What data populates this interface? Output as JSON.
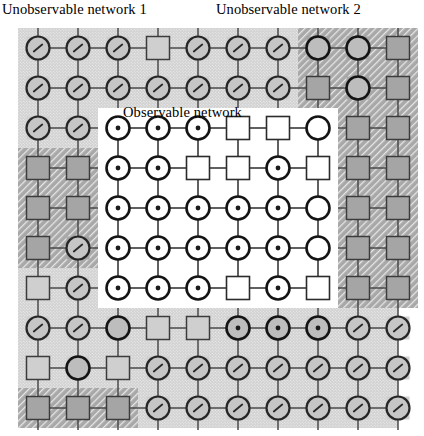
{
  "labels": {
    "unobservable_1": "Unobservable network 1",
    "unobservable_2": "Unobservable network 2",
    "observable": "Observable network"
  },
  "colors": {
    "node_stroke_dark": "#141414",
    "node_stroke_mid": "#3a3a3a",
    "edge": "#4a4a4a",
    "bg_light": "#d2d2d2",
    "bg_dark": "#a8a8a8",
    "bg_white": "#ffffff",
    "text": "#000000"
  },
  "icons": {
    "node_meter": "circle-with-tick-icon",
    "node_dot": "circle-with-dot-icon",
    "node_plain_circle": "plain-circle-icon",
    "node_square": "square-node-icon"
  },
  "chart_data": {
    "type": "diagram",
    "grid": {
      "rows": 10,
      "cols": 10,
      "origin_x": 38,
      "origin_y": 48,
      "spacing": 40,
      "node_radius": 11.5,
      "square_half": 11.5
    },
    "regions": [
      {
        "name": "unobservable-network-1-main",
        "style": "light",
        "x": 18,
        "y": 28,
        "w": 280,
        "h": 120
      },
      {
        "name": "unobservable-network-1-left",
        "style": "light",
        "x": 18,
        "y": 148,
        "w": 80,
        "h": 280
      },
      {
        "name": "unobservable-network-1-bottom",
        "style": "light",
        "x": 18,
        "y": 308,
        "w": 380,
        "h": 120
      },
      {
        "name": "unobservable-network-1-bottom-right",
        "style": "light",
        "x": 138,
        "y": 308,
        "w": 260,
        "h": 120
      },
      {
        "name": "unobservable-network-2-main",
        "style": "dark",
        "x": 298,
        "y": 28,
        "w": 120,
        "h": 280
      },
      {
        "name": "unobservable-network-2-left-block",
        "style": "dark",
        "x": 18,
        "y": 148,
        "w": 80,
        "h": 120
      },
      {
        "name": "unobservable-network-2-bottom-left",
        "style": "dark",
        "x": 18,
        "y": 388,
        "w": 120,
        "h": 40
      },
      {
        "name": "unobservable-network-2-right-strip",
        "style": "dark",
        "x": 338,
        "y": 148,
        "w": 80,
        "h": 160
      },
      {
        "name": "observable-network",
        "style": "white",
        "x": 98,
        "y": 108,
        "w": 240,
        "h": 200
      }
    ],
    "node_types_legend": {
      "meter": "circle outlined, grey fill, small diagonal tick inside",
      "dot": "circle outlined, white fill, small dark dot inside",
      "plain": "circle outlined, no interior mark",
      "square": "square outlined, region-coloured fill"
    },
    "rows": [
      {
        "y": 48,
        "cells": [
          "meter",
          "meter",
          "meter",
          "square",
          "meter",
          "meter",
          "meter",
          "plain",
          "plain",
          "square"
        ]
      },
      {
        "y": 88,
        "cells": [
          "meter",
          "meter",
          "meter",
          "meter",
          "meter",
          "meter",
          "meter",
          "square",
          "plain",
          "square"
        ]
      },
      {
        "y": 128,
        "cells": [
          "meter",
          "meter",
          "dot",
          "dot",
          "dot",
          "square",
          "square",
          "plain",
          "square",
          "square"
        ]
      },
      {
        "y": 168,
        "cells": [
          "square",
          "square",
          "dot",
          "dot",
          "square",
          "square",
          "dot",
          "square",
          "square",
          "square"
        ]
      },
      {
        "y": 208,
        "cells": [
          "square",
          "square",
          "dot",
          "dot",
          "dot",
          "dot",
          "dot",
          "plain",
          "square",
          "square"
        ]
      },
      {
        "y": 248,
        "cells": [
          "square",
          "meter",
          "dot",
          "dot",
          "dot",
          "dot",
          "dot",
          "plain",
          "square",
          "square"
        ]
      },
      {
        "y": 288,
        "cells": [
          "square",
          "meter",
          "dot",
          "dot",
          "dot",
          "square",
          "dot",
          "square",
          "square",
          "square"
        ]
      },
      {
        "y": 328,
        "cells": [
          "meter",
          "meter",
          "plain",
          "square",
          "square",
          "dot",
          "dot",
          "dot",
          "meter",
          "meter"
        ]
      },
      {
        "y": 368,
        "cells": [
          "square",
          "plain",
          "square",
          "meter",
          "meter",
          "meter",
          "meter",
          "meter",
          "meter",
          "meter"
        ]
      },
      {
        "y": 408,
        "cells": [
          "square",
          "square",
          "square",
          "meter",
          "meter",
          "meter",
          "meter",
          "meter",
          "meter",
          "meter"
        ]
      }
    ],
    "edges": "4-neighbour lattice: every node joined horizontally to its row neighbour and vertically to its column neighbour; short stubs extend above row 1 and below row 10"
  }
}
